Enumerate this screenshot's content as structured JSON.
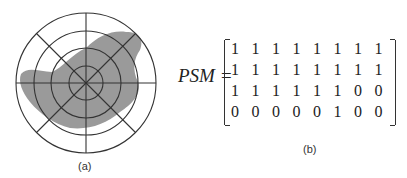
{
  "panel_a": {
    "caption": "(a)",
    "rings": 4,
    "spokes": 8,
    "fill_color": "#9a9a9a"
  },
  "panel_b": {
    "caption": "(b)",
    "label": "PSM =",
    "matrix": [
      [
        "1",
        "1",
        "1",
        "1",
        "1",
        "1",
        "1",
        "1"
      ],
      [
        "1",
        "1",
        "1",
        "1",
        "1",
        "1",
        "1",
        "1"
      ],
      [
        "1",
        "1",
        "1",
        "1",
        "1",
        "1",
        "0",
        "0"
      ],
      [
        "0",
        "0",
        "0",
        "0",
        "0",
        "1",
        "0",
        "0"
      ]
    ]
  }
}
